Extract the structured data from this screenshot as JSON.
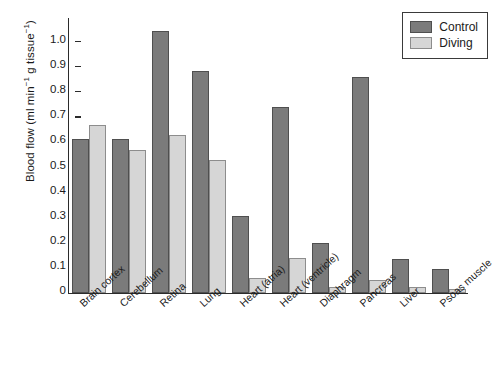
{
  "chart_data": {
    "type": "bar",
    "title": "",
    "subtitle": "",
    "xlabel": "",
    "ylabel": "Blood flow (ml min⁻¹ g tissue⁻¹)",
    "ylabel_parts": {
      "base": "Blood flow (ml min",
      "sup1": "−1",
      "mid": " g tissue",
      "sup2": "−1",
      "close": ")"
    },
    "ylim": [
      0,
      1.1
    ],
    "ytick_values": [
      0,
      0.1,
      0.2,
      0.3,
      0.4,
      0.5,
      0.6,
      0.7,
      0.8,
      0.9,
      1.0
    ],
    "ytick_labels": [
      "0",
      "0.1",
      "0.2",
      "0.3",
      "0.4",
      "0.5",
      "0.6",
      "0.7",
      "0.8",
      "0.9",
      "1.0"
    ],
    "grid": false,
    "legend_position": "top-right",
    "categories": [
      "Brain cortex",
      "Cerebellum",
      "Retina",
      "Lung",
      "Heart (atria)",
      "Heart (ventricle)",
      "Diaphragm",
      "Pancreas",
      "Liver",
      "Psoas muscle"
    ],
    "series": [
      {
        "name": "Control",
        "color": "#7b7b7b",
        "values": [
          0.615,
          0.615,
          1.045,
          0.885,
          0.305,
          0.74,
          0.2,
          0.86,
          0.135,
          0.095
        ]
      },
      {
        "name": "Diving",
        "color": "#d6d6d6",
        "values": [
          0.67,
          0.57,
          0.63,
          0.53,
          0.06,
          0.14,
          0.025,
          0.05,
          0.025,
          0.015
        ]
      }
    ]
  },
  "legend": {
    "entries": [
      {
        "label": "Control",
        "swatch": "control"
      },
      {
        "label": "Diving",
        "swatch": "diving"
      }
    ]
  }
}
